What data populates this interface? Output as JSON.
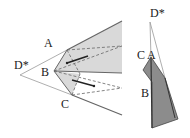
{
  "diagram": {
    "left_figure": {
      "labels": {
        "d_star": "D*",
        "a": "A",
        "b": "B",
        "c": "C"
      }
    },
    "right_figure": {
      "labels": {
        "d_star": "D*",
        "c": "C",
        "a": "A",
        "b": "B"
      }
    },
    "colors": {
      "shade_light": "#d9d9d9",
      "shade_dark": "#8c8c8c",
      "line": "#555555",
      "thin_line": "#999999"
    }
  }
}
